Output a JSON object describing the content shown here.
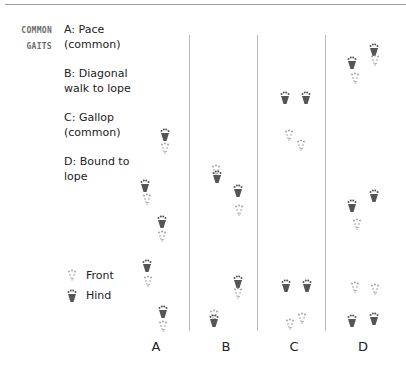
{
  "heading": {
    "line1": "COMMON",
    "line2": "GAITS"
  },
  "gaits": [
    {
      "label": "A: Pace\n(common)"
    },
    {
      "label": "B: Diagonal\nwalk to lope"
    },
    {
      "label": "C: Gallop\n(common)"
    },
    {
      "label": "D: Bound to\nlope"
    }
  ],
  "key": {
    "front": "Front",
    "hind": "Hind"
  },
  "columns": [
    "A",
    "B",
    "C",
    "D"
  ],
  "colors": {
    "hind": "#555555",
    "front": "#9a9a9a",
    "divider": "#b8b8b8",
    "rule": "#9a9a9a"
  },
  "tracks": {
    "A": [
      {
        "type": "hind",
        "x": 165,
        "y": 134
      },
      {
        "type": "front",
        "x": 165,
        "y": 146
      },
      {
        "type": "hind",
        "x": 145,
        "y": 185
      },
      {
        "type": "front",
        "x": 147,
        "y": 197
      },
      {
        "type": "hind",
        "x": 162,
        "y": 221
      },
      {
        "type": "front",
        "x": 162,
        "y": 234
      },
      {
        "type": "hind",
        "x": 147,
        "y": 265
      },
      {
        "type": "front",
        "x": 148,
        "y": 279
      },
      {
        "type": "hind",
        "x": 163,
        "y": 311
      },
      {
        "type": "front",
        "x": 163,
        "y": 324
      }
    ],
    "B": [
      {
        "type": "front",
        "x": 216,
        "y": 168
      },
      {
        "type": "hind",
        "x": 217,
        "y": 176
      },
      {
        "type": "hind",
        "x": 238,
        "y": 190
      },
      {
        "type": "front",
        "x": 239,
        "y": 208
      },
      {
        "type": "hind",
        "x": 238,
        "y": 281
      },
      {
        "type": "front",
        "x": 238,
        "y": 291
      },
      {
        "type": "front",
        "x": 214,
        "y": 313
      },
      {
        "type": "hind",
        "x": 214,
        "y": 320
      }
    ],
    "C": [
      {
        "type": "hind",
        "x": 285,
        "y": 97
      },
      {
        "type": "hind",
        "x": 306,
        "y": 97
      },
      {
        "type": "front",
        "x": 289,
        "y": 133
      },
      {
        "type": "front",
        "x": 301,
        "y": 143
      },
      {
        "type": "hind",
        "x": 286,
        "y": 285
      },
      {
        "type": "hind",
        "x": 307,
        "y": 285
      },
      {
        "type": "front",
        "x": 290,
        "y": 322
      },
      {
        "type": "front",
        "x": 302,
        "y": 316
      }
    ],
    "D": [
      {
        "type": "hind",
        "x": 374,
        "y": 49
      },
      {
        "type": "front",
        "x": 375,
        "y": 58
      },
      {
        "type": "hind",
        "x": 352,
        "y": 62
      },
      {
        "type": "front",
        "x": 355,
        "y": 76
      },
      {
        "type": "hind",
        "x": 374,
        "y": 195
      },
      {
        "type": "hind",
        "x": 352,
        "y": 205
      },
      {
        "type": "front",
        "x": 357,
        "y": 222
      },
      {
        "type": "front",
        "x": 355,
        "y": 285
      },
      {
        "type": "front",
        "x": 375,
        "y": 287
      },
      {
        "type": "hind",
        "x": 352,
        "y": 320
      },
      {
        "type": "hind",
        "x": 374,
        "y": 318
      }
    ]
  }
}
